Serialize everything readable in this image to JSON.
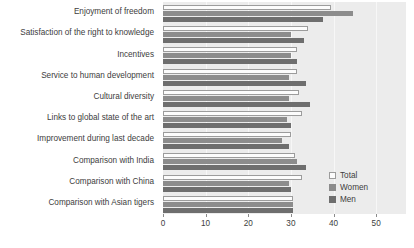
{
  "chart_data": {
    "type": "bar",
    "orientation": "horizontal",
    "title": "",
    "xlabel": "",
    "ylabel": "",
    "xlim": [
      0,
      57
    ],
    "xticks": [
      0,
      10,
      20,
      30,
      40,
      50
    ],
    "xtick_labels": [
      "0",
      "10",
      "20",
      "30",
      "40",
      "50"
    ],
    "grid": true,
    "grid_axis": "x",
    "legend_position": "bottom-right",
    "categories": [
      "Enjoyment of freedom",
      "Satisfaction of the right to knowledge",
      "Incentives",
      "Service to human development",
      "Cultural diversity",
      "Links to global state of the art",
      "Improvement during last decade",
      "Comparison with India",
      "Comparison with China",
      "Comparison with Asian tigers"
    ],
    "series": [
      {
        "name": "Total",
        "color": "#fcfcfc",
        "edge_color": "#9c9c9c",
        "values": [
          39.5,
          34.0,
          31.5,
          31.5,
          32.0,
          32.5,
          30.0,
          31.0,
          32.5,
          30.5
        ]
      },
      {
        "name": "Women",
        "color": "#8c8c8c",
        "values": [
          44.5,
          30.0,
          30.0,
          29.5,
          29.5,
          29.0,
          28.0,
          31.5,
          29.5,
          30.5
        ]
      },
      {
        "name": "Men",
        "color": "#6e6e6e",
        "values": [
          37.5,
          33.0,
          31.5,
          33.5,
          34.5,
          30.0,
          29.5,
          33.5,
          30.0,
          30.5
        ]
      }
    ]
  },
  "legend": {
    "items": [
      {
        "label": "Total",
        "key": "total"
      },
      {
        "label": "Women",
        "key": "women"
      },
      {
        "label": "Men",
        "key": "men"
      }
    ]
  },
  "colors": {
    "plot_background": "#ececec",
    "gridline": "#f7f7f7",
    "axis_text": "#3d3d3d",
    "page_background": "#ffffff"
  }
}
